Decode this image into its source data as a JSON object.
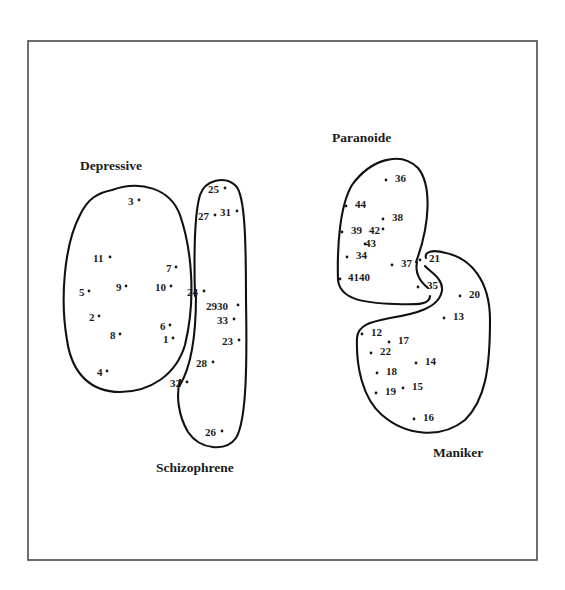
{
  "figure": {
    "groups": [
      {
        "id": "depressive",
        "label": "Depressive"
      },
      {
        "id": "schizophrene",
        "label": "Schizophrene"
      },
      {
        "id": "paranoide",
        "label": "Paranoide"
      },
      {
        "id": "maniker",
        "label": "Maniker"
      }
    ],
    "points": [
      {
        "n": "3",
        "x": 128,
        "y": 201,
        "dx": 11,
        "dy": -3
      },
      {
        "n": "11",
        "x": 93,
        "y": 258,
        "dx": 17,
        "dy": -3
      },
      {
        "n": "7",
        "x": 166,
        "y": 268,
        "dx": 10,
        "dy": -3
      },
      {
        "n": "5",
        "x": 79,
        "y": 292,
        "dx": 10,
        "dy": -3
      },
      {
        "n": "9",
        "x": 116,
        "y": 287,
        "dx": 10,
        "dy": -3
      },
      {
        "n": "10",
        "x": 155,
        "y": 287,
        "dx": 16,
        "dy": -3
      },
      {
        "n": "2",
        "x": 89,
        "y": 317,
        "dx": 10,
        "dy": -3
      },
      {
        "n": "8",
        "x": 110,
        "y": 335,
        "dx": 10,
        "dy": -3
      },
      {
        "n": "6",
        "x": 160,
        "y": 326,
        "dx": 10,
        "dy": -3
      },
      {
        "n": "1",
        "x": 163,
        "y": 339,
        "dx": 10,
        "dy": -3
      },
      {
        "n": "4",
        "x": 97,
        "y": 372,
        "dx": 10,
        "dy": -3
      },
      {
        "n": "25",
        "x": 208,
        "y": 189,
        "dx": 17,
        "dy": -3
      },
      {
        "n": "27",
        "x": 198,
        "y": 216,
        "dx": 17,
        "dy": -3
      },
      {
        "n": "31",
        "x": 220,
        "y": 212,
        "dx": 17,
        "dy": -3
      },
      {
        "n": "24",
        "x": 187,
        "y": 292,
        "dx": 17,
        "dy": -3
      },
      {
        "n": "2930",
        "x": 206,
        "y": 306,
        "dx": 32,
        "dy": -3
      },
      {
        "n": "33",
        "x": 217,
        "y": 320,
        "dx": 17,
        "dy": -3
      },
      {
        "n": "23",
        "x": 222,
        "y": 341,
        "dx": 17,
        "dy": -3
      },
      {
        "n": "28",
        "x": 196,
        "y": 363,
        "dx": 17,
        "dy": -3
      },
      {
        "n": "32",
        "x": 170,
        "y": 383,
        "dx": 17,
        "dy": -3
      },
      {
        "n": "26",
        "x": 205,
        "y": 432,
        "dx": 17,
        "dy": -3
      },
      {
        "n": "36",
        "x": 395,
        "y": 178,
        "dx": -9,
        "dy": 0
      },
      {
        "n": "44",
        "x": 355,
        "y": 204,
        "dx": -9,
        "dy": 0
      },
      {
        "n": "38",
        "x": 392,
        "y": 217,
        "dx": -9,
        "dy": 0
      },
      {
        "n": "39",
        "x": 351,
        "y": 230,
        "dx": -9,
        "dy": 0
      },
      {
        "n": "42",
        "x": 369,
        "y": 230,
        "dx": 14,
        "dy": -3
      },
      {
        "n": "43",
        "x": 365,
        "y": 243,
        "dx": 0,
        "dy": -1
      },
      {
        "n": "34",
        "x": 356,
        "y": 255,
        "dx": -9,
        "dy": 0
      },
      {
        "n": "37",
        "x": 401,
        "y": 263,
        "dx": -9,
        "dy": 0
      },
      {
        "n": "21",
        "x": 429,
        "y": 258,
        "dx": -9,
        "dy": 0
      },
      {
        "n": "4140",
        "x": 348,
        "y": 277,
        "dx": -8,
        "dy": 0
      },
      {
        "n": "35",
        "x": 427,
        "y": 285,
        "dx": -9,
        "dy": 0
      },
      {
        "n": "20",
        "x": 469,
        "y": 294,
        "dx": -9,
        "dy": 0
      },
      {
        "n": "13",
        "x": 453,
        "y": 316,
        "dx": -9,
        "dy": 0
      },
      {
        "n": "12",
        "x": 371,
        "y": 332,
        "dx": -9,
        "dy": 0
      },
      {
        "n": "17",
        "x": 398,
        "y": 340,
        "dx": -9,
        "dy": 0
      },
      {
        "n": "22",
        "x": 380,
        "y": 351,
        "dx": -9,
        "dy": 0
      },
      {
        "n": "14",
        "x": 425,
        "y": 361,
        "dx": -9,
        "dy": 0
      },
      {
        "n": "18",
        "x": 386,
        "y": 371,
        "dx": -9,
        "dy": 0
      },
      {
        "n": "19",
        "x": 385,
        "y": 391,
        "dx": -9,
        "dy": 0
      },
      {
        "n": "15",
        "x": 412,
        "y": 386,
        "dx": -9,
        "dy": 0
      },
      {
        "n": "16",
        "x": 423,
        "y": 417,
        "dx": -9,
        "dy": 0
      }
    ]
  }
}
